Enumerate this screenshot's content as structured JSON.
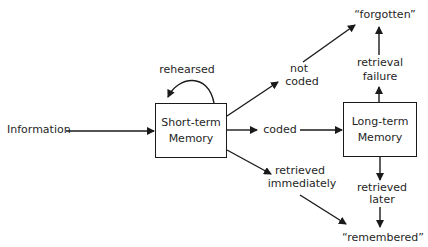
{
  "diagram": {
    "title": "",
    "input_label": "Information",
    "short_term": {
      "line1": "Short-term",
      "line2": "Memory"
    },
    "long_term": {
      "line1": "Long-term",
      "line2": "Memory"
    },
    "edges": {
      "rehearsed": "rehearsed",
      "not_coded": {
        "line1": "not",
        "line2": "coded"
      },
      "coded": "coded",
      "retrieved_immediately": {
        "line1": "retrieved",
        "line2": "immediately"
      },
      "retrieval_failure": {
        "line1": "retrieval",
        "line2": "failure"
      },
      "retrieved_later": {
        "line1": "retrieved",
        "line2": "later"
      }
    },
    "outcomes": {
      "forgotten": "“forgotten”",
      "remembered": "“remembered”"
    },
    "colors": {
      "stroke": "#1a1a1a",
      "background": "#ffffff",
      "text": "#1f1f1f"
    }
  }
}
